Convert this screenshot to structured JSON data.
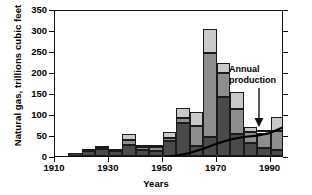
{
  "chart_data": {
    "type": "bar",
    "title": "",
    "xlabel": "Years",
    "ylabel": "Natural gas, trillions cubic feet",
    "xlim": [
      1910,
      1995
    ],
    "ylim": [
      0,
      350
    ],
    "ytick_labels": [
      "0",
      "50",
      "100",
      "150",
      "200",
      "250",
      "300",
      "350"
    ],
    "ytick_values": [
      0,
      50,
      100,
      150,
      200,
      250,
      300,
      350
    ],
    "xtick_labels": [
      "1910",
      "1930",
      "1950",
      "1970",
      "1990"
    ],
    "xtick_values": [
      1910,
      1930,
      1950,
      1970,
      1990
    ],
    "grid": false,
    "legend": "none",
    "stacked": true,
    "bar_interval_years": 5,
    "categories": [
      1910,
      1915,
      1920,
      1925,
      1930,
      1935,
      1940,
      1945,
      1950,
      1955,
      1960,
      1965,
      1970,
      1975,
      1980,
      1985,
      1990
    ],
    "series": [
      {
        "name": "segment-dark",
        "color": "#4a4a4a",
        "values": [
          0,
          8,
          11,
          16,
          12,
          27,
          15,
          11,
          36,
          79,
          24,
          46,
          141,
          53,
          30,
          20,
          15
        ]
      },
      {
        "name": "segment-medium",
        "color": "#8e8e8e",
        "values": [
          0,
          0,
          1,
          3,
          2,
          10,
          6,
          11,
          8,
          12,
          47,
          200,
          56,
          58,
          27,
          36,
          45
        ]
      },
      {
        "name": "segment-light",
        "color": "#c9c9c9",
        "values": [
          0,
          0,
          0,
          1,
          0,
          16,
          3,
          1,
          14,
          23,
          34,
          56,
          25,
          42,
          11,
          2,
          33
        ]
      }
    ],
    "totals": [
      0,
      8,
      12,
      20,
      14,
      53,
      24,
      23,
      58,
      114,
      105,
      302,
      222,
      153,
      68,
      58,
      93
    ],
    "annotations": [
      {
        "name": "annual-production",
        "text_line1": "Annual",
        "text_line2": "production",
        "points_to_year": 1988,
        "points_to_value": 60
      }
    ],
    "overlay_curve": {
      "name": "annual-production-curve",
      "x": [
        1950,
        1955,
        1960,
        1965,
        1970,
        1975,
        1980,
        1985,
        1990,
        1995
      ],
      "y": [
        2,
        6,
        12,
        22,
        34,
        44,
        50,
        53,
        60,
        74
      ]
    }
  }
}
